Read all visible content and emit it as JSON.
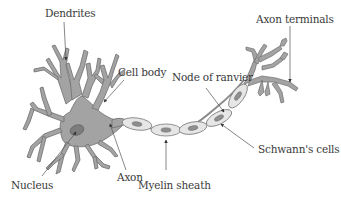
{
  "diagram": {
    "colors": {
      "cell_fill": "#a3a3a3",
      "cell_stroke": "#6e6e6e",
      "myelin_fill": "#e6e6e6",
      "myelin_stroke": "#7a7a7a",
      "nucleus_fill": "#7d7d7d",
      "text": "#3a3a3a",
      "leader_line": "#555555"
    },
    "labels": {
      "dendrites": "Dendrites",
      "cell_body": "Cell body",
      "nucleus": "Nucleus",
      "axon": "Axon",
      "myelin_sheath": "Myelin sheath",
      "node_of_ranvier": "Node of ranvier",
      "schwanns_cells": "Schwann's cells",
      "axon_terminals": "Axon terminals"
    }
  }
}
